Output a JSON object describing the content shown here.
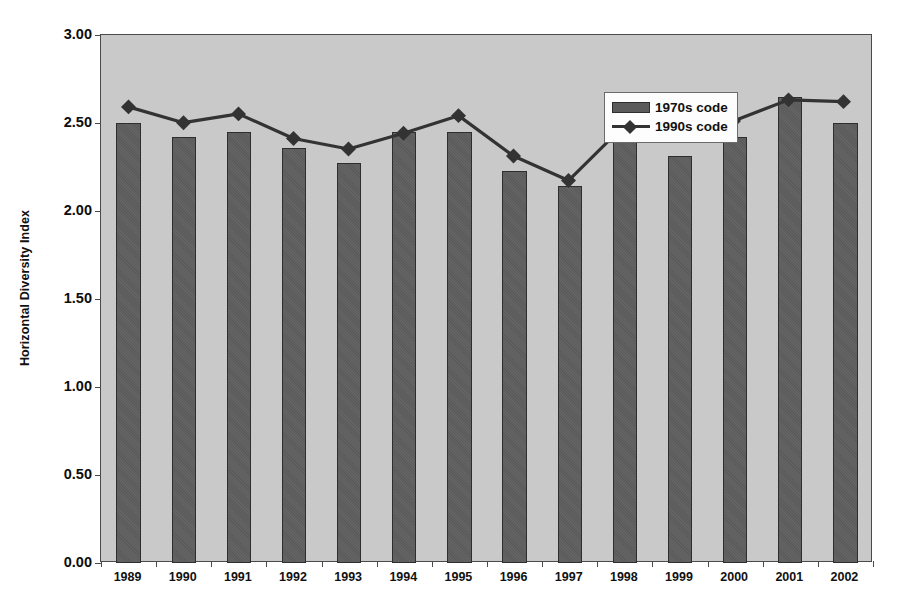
{
  "chart_data": {
    "type": "bar",
    "title": "",
    "subtitle": "",
    "xlabel": "",
    "ylabel": "Horizontal Diversity Index",
    "categories": [
      "1989",
      "1990",
      "1991",
      "1992",
      "1993",
      "1994",
      "1995",
      "1996",
      "1997",
      "1998",
      "1999",
      "2000",
      "2001",
      "2002"
    ],
    "ylim": [
      0.0,
      3.0
    ],
    "ytick_labels": [
      "0.00",
      "0.50",
      "1.00",
      "1.50",
      "2.00",
      "2.50",
      "3.00"
    ],
    "ytick_values": [
      0.0,
      0.5,
      1.0,
      1.5,
      2.0,
      2.5,
      3.0
    ],
    "grid": false,
    "legend_position": "top-center-inside",
    "series": [
      {
        "name": "1970s code",
        "type": "bar",
        "color": "#5b5b5b",
        "values": [
          2.5,
          2.42,
          2.45,
          2.36,
          2.27,
          2.45,
          2.45,
          2.23,
          2.14,
          2.49,
          2.31,
          2.42,
          2.65,
          2.5
        ]
      },
      {
        "name": "1990s code",
        "type": "line",
        "color": "#333333",
        "marker": "diamond",
        "values": [
          2.59,
          2.5,
          2.55,
          2.41,
          2.35,
          2.44,
          2.54,
          2.31,
          2.17,
          2.48,
          2.49,
          2.51,
          2.63,
          2.62
        ]
      }
    ]
  },
  "legend": {
    "entries": [
      {
        "label": "1970s code",
        "swatch": "bar-swatch"
      },
      {
        "label": "1990s code",
        "swatch": "line-marker-swatch"
      }
    ]
  },
  "colors": {
    "plot_background": "#c9c9c9",
    "bar_fill": "#5b5b5b",
    "bar_border": "#2e2e2e",
    "line": "#333333",
    "axis": "#4a4a4a",
    "text": "#111111",
    "legend_background": "#fdfdfd"
  }
}
